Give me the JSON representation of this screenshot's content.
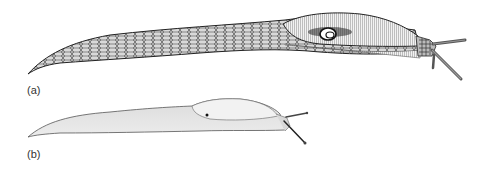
{
  "figure": {
    "panels": [
      {
        "label": "(a)",
        "subject": "slug-large-detailed"
      },
      {
        "label": "(b)",
        "subject": "slug-small-light"
      }
    ],
    "colors": {
      "ink": "#222222",
      "shade_a": "#8a8a8a",
      "shade_b": "#cfcfcf",
      "background": "#ffffff"
    }
  }
}
